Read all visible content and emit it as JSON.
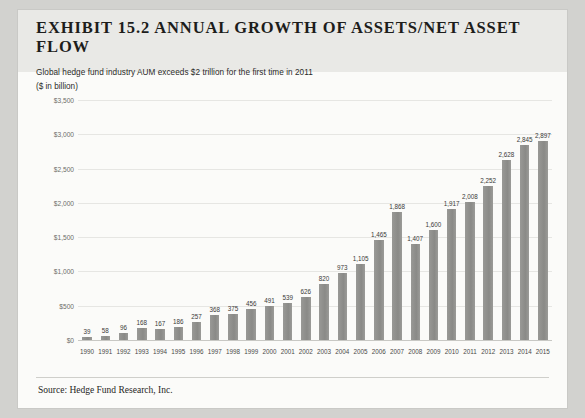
{
  "exhibit": {
    "title": "EXHIBIT 15.2 ANNUAL GROWTH OF ASSETS/NET ASSET FLOW",
    "subtitle": "Global hedge fund industry AUM exceeds $2 trillion for the first time in 2011",
    "units": "($ in billion)",
    "source": "Source: Hedge Fund Research, Inc."
  },
  "chart_data": {
    "type": "bar",
    "title": "EXHIBIT 15.2 ANNUAL GROWTH OF ASSETS/NET ASSET FLOW",
    "subtitle": "Global hedge fund industry AUM exceeds $2 trillion for the first time in 2011",
    "xlabel": "",
    "ylabel": "($ in billion)",
    "ylim": [
      0,
      3500
    ],
    "ytick_step": 500,
    "ytick_labels": [
      "$0",
      "$500",
      "$1,000",
      "$1,500",
      "$2,000",
      "$2,500",
      "$3,000",
      "$3,500"
    ],
    "ytick_values": [
      0,
      500,
      1000,
      1500,
      2000,
      2500,
      3000,
      3500
    ],
    "grid": true,
    "legend": false,
    "bar_color": "#8e8e8b",
    "categories": [
      "1990",
      "1991",
      "1992",
      "1993",
      "1994",
      "1995",
      "1996",
      "1997",
      "1998",
      "1999",
      "2000",
      "2001",
      "2002",
      "2003",
      "2004",
      "2005",
      "2006",
      "2007",
      "2008",
      "2009",
      "2010",
      "2011",
      "2012",
      "2013",
      "2014",
      "2015"
    ],
    "values": [
      39,
      58,
      96,
      168,
      167,
      186,
      257,
      368,
      375,
      456,
      491,
      539,
      626,
      820,
      973,
      1105,
      1465,
      1868,
      1407,
      1600,
      1917,
      2008,
      2252,
      2628,
      2845,
      2897
    ],
    "value_labels": [
      "39",
      "58",
      "96",
      "168",
      "167",
      "186",
      "257",
      "368",
      "375",
      "456",
      "491",
      "539",
      "626",
      "820",
      "973",
      "1,105",
      "1,465",
      "1,868",
      "1,407",
      "1,600",
      "1,917",
      "2,008",
      "2,252",
      "2,628",
      "2,845",
      "2,897"
    ]
  }
}
